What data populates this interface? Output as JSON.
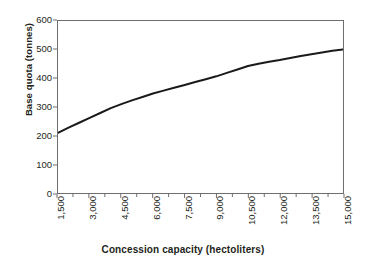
{
  "chart_data": {
    "type": "line",
    "title": "",
    "xlabel": "Concession capacity (hectoliters)",
    "ylabel": "Base quota (tonnes)",
    "xlim": [
      1500,
      15000
    ],
    "ylim": [
      0,
      600
    ],
    "grid": false,
    "legend": "none",
    "x_tick_labels": [
      "1,500",
      "3,000",
      "4,500",
      "6,000",
      "7,500",
      "9,000",
      "10,500",
      "12,000",
      "13,500",
      "15,000"
    ],
    "x_tick_values": [
      1500,
      3000,
      4500,
      6000,
      7500,
      9000,
      10500,
      12000,
      13500,
      15000
    ],
    "y_tick_labels": [
      "0",
      "100",
      "200",
      "300",
      "400",
      "500",
      "600"
    ],
    "y_tick_values": [
      0,
      100,
      200,
      300,
      400,
      500,
      600
    ],
    "series": [
      {
        "name": "Base quota",
        "color": "#1a1a1a",
        "x": [
          1500,
          2000,
          2500,
          3000,
          3500,
          4000,
          4500,
          5000,
          5500,
          6000,
          6500,
          7000,
          7500,
          8000,
          8500,
          9000,
          9500,
          10000,
          10500,
          11000,
          11500,
          12000,
          12500,
          13000,
          13500,
          14000,
          14500,
          15000
        ],
        "values": [
          210,
          228,
          245,
          262,
          279,
          296,
          310,
          323,
          335,
          347,
          357,
          367,
          377,
          387,
          397,
          407,
          419,
          431,
          443,
          451,
          458,
          464,
          471,
          478,
          484,
          490,
          496,
          501
        ]
      }
    ]
  },
  "axes": {
    "x_title": "Concession capacity (hectoliters)",
    "y_title": "Base quota (tonnes)"
  },
  "colors": {
    "line": "#1a1a1a",
    "frame": "#6e6e70",
    "text": "#231f20",
    "background": "#ffffff"
  }
}
